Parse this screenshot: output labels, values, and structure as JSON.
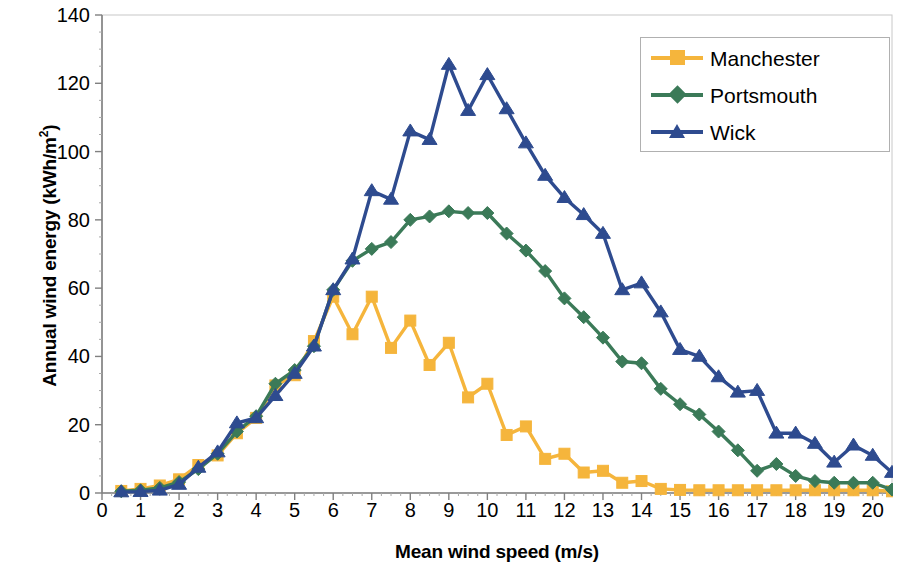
{
  "chart_data": {
    "type": "line",
    "title": "",
    "xlabel": "Mean wind speed (m/s)",
    "ylabel": "Annual wind energy (kWh/m²)",
    "ylabel_main": "Annual wind energy (kWh/m",
    "ylabel_sup": "2",
    "ylabel_tail": ")",
    "xlim": [
      0,
      20.5
    ],
    "ylim": [
      0,
      140
    ],
    "xticks": [
      0,
      1,
      2,
      3,
      4,
      5,
      6,
      7,
      8,
      9,
      10,
      11,
      12,
      13,
      14,
      15,
      16,
      17,
      18,
      19,
      20
    ],
    "yticks": [
      0,
      20,
      40,
      60,
      80,
      100,
      120,
      140
    ],
    "grid": false,
    "legend_position": "top-right",
    "x": [
      0.5,
      1.0,
      1.5,
      2.0,
      2.5,
      3.0,
      3.5,
      4.0,
      4.5,
      5.0,
      5.5,
      6.0,
      6.5,
      7.0,
      7.5,
      8.0,
      8.5,
      9.0,
      9.5,
      10.0,
      10.5,
      11.0,
      11.5,
      12.0,
      12.5,
      13.0,
      13.5,
      14.0,
      14.5,
      15.0,
      15.5,
      16.0,
      16.5,
      17.0,
      17.5,
      18.0,
      18.5,
      19.0,
      19.5,
      20.0,
      20.5
    ],
    "series": [
      {
        "name": "Manchester",
        "color": "#F5B53C",
        "marker": "square",
        "values": [
          0.6,
          1.2,
          2.2,
          4.0,
          8.2,
          11.0,
          17.5,
          22.0,
          31.5,
          34.5,
          44.5,
          57.5,
          46.5,
          57.5,
          42.5,
          50.5,
          37.5,
          44.0,
          28.0,
          32.0,
          17.0,
          19.5,
          10.0,
          11.5,
          6.0,
          6.5,
          3.0,
          3.5,
          1.2,
          0.9,
          0.8,
          0.8,
          0.8,
          0.8,
          0.8,
          0.8,
          0.8,
          0.8,
          0.8,
          0.8,
          0.5
        ]
      },
      {
        "name": "Portsmouth",
        "color": "#3B7A58",
        "marker": "diamond",
        "values": [
          0.5,
          0.8,
          1.5,
          3.2,
          7.0,
          11.5,
          18.0,
          22.5,
          32.0,
          36.0,
          43.0,
          59.5,
          68.0,
          71.5,
          73.5,
          80.0,
          81.0,
          82.5,
          82.0,
          82.0,
          76.0,
          71.0,
          65.0,
          57.0,
          51.5,
          45.5,
          38.5,
          38.0,
          30.5,
          26.0,
          23.0,
          18.0,
          12.5,
          6.5,
          8.5,
          5.0,
          3.5,
          3.0,
          3.0,
          3.0,
          1.0
        ]
      },
      {
        "name": "Wick",
        "color": "#2E4B8F",
        "marker": "triangle",
        "values": [
          0.3,
          0.4,
          0.8,
          2.5,
          7.5,
          12.0,
          20.5,
          22.0,
          28.5,
          35.0,
          43.0,
          59.5,
          68.5,
          88.5,
          86.0,
          106.0,
          103.5,
          125.5,
          112.0,
          122.5,
          112.5,
          102.5,
          93.0,
          86.5,
          81.5,
          76.0,
          59.5,
          61.5,
          53.0,
          42.0,
          40.0,
          34.0,
          29.5,
          30.0,
          17.5,
          17.5,
          14.5,
          9.0,
          14.0,
          11.0,
          6.0
        ]
      }
    ]
  },
  "legend": {
    "items": [
      {
        "label": "Manchester"
      },
      {
        "label": "Portsmouth"
      },
      {
        "label": "Wick"
      }
    ]
  }
}
